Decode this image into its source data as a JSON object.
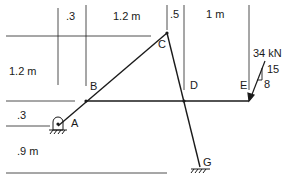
{
  "diagram": {
    "type": "frame-structure",
    "dimensions": {
      "top": [
        ".3",
        "1.2 m",
        ".5",
        "1 m"
      ],
      "left": [
        "1.2 m",
        ".3",
        ".9 m"
      ]
    },
    "points": {
      "A": "A",
      "B": "B",
      "C": "C",
      "D": "D",
      "E": "E",
      "G": "G"
    },
    "load": {
      "magnitude": "34 kN",
      "slope_vertical": "15",
      "slope_horizontal": "8"
    },
    "colors": {
      "line": "#1a1a1a",
      "background": "#ffffff"
    }
  }
}
